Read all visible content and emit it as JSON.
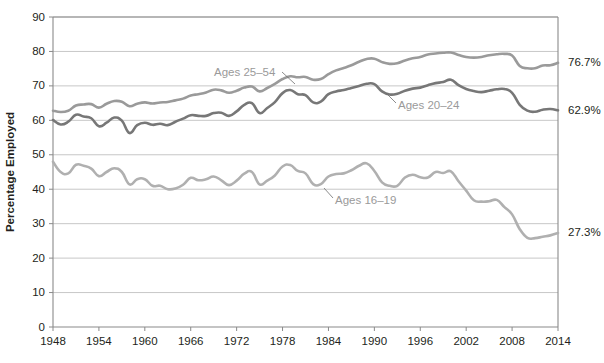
{
  "chart_data": {
    "type": "line",
    "title": "",
    "xlabel": "",
    "ylabel": "Percentage Employed",
    "xlim": [
      1948,
      2014
    ],
    "ylim": [
      0,
      90
    ],
    "grid": true,
    "legend_position": "inline-annotations",
    "yticks": [
      0,
      10,
      20,
      30,
      40,
      50,
      60,
      70,
      80,
      90
    ],
    "ytick_labels": [
      "0",
      "10",
      "20",
      "30",
      "40",
      "50",
      "60",
      "70",
      "80",
      "90"
    ],
    "xticks": [
      1948,
      1954,
      1960,
      1966,
      1972,
      1978,
      1984,
      1990,
      1996,
      2002,
      2008,
      2014
    ],
    "xtick_labels": [
      "1948",
      "1954",
      "1960",
      "1966",
      "1972",
      "1978",
      "1984",
      "1990",
      "1996",
      "2002",
      "2008",
      "2014"
    ],
    "x": [
      1948,
      1949,
      1950,
      1951,
      1952,
      1953,
      1954,
      1955,
      1956,
      1957,
      1958,
      1959,
      1960,
      1961,
      1962,
      1963,
      1964,
      1965,
      1966,
      1967,
      1968,
      1969,
      1970,
      1971,
      1972,
      1973,
      1974,
      1975,
      1976,
      1977,
      1978,
      1979,
      1980,
      1981,
      1982,
      1983,
      1984,
      1985,
      1986,
      1987,
      1988,
      1989,
      1990,
      1991,
      1992,
      1993,
      1994,
      1995,
      1996,
      1997,
      1998,
      1999,
      2000,
      2001,
      2002,
      2003,
      2004,
      2005,
      2006,
      2007,
      2008,
      2009,
      2010,
      2011,
      2012,
      2013,
      2014
    ],
    "series": [
      {
        "name": "Ages 25-54",
        "label": "Ages 25–54",
        "color": "#9a9a9a",
        "end_value_label": "76.7%",
        "end_value": 76.7,
        "values": [
          62.8,
          62.4,
          62.8,
          64.3,
          64.6,
          64.7,
          63.7,
          64.8,
          65.6,
          65.4,
          64.1,
          64.8,
          65.2,
          64.9,
          65.2,
          65.3,
          65.8,
          66.3,
          67.2,
          67.6,
          68.1,
          68.9,
          68.7,
          68.0,
          68.6,
          69.5,
          69.8,
          68.4,
          69.4,
          70.6,
          72.0,
          72.8,
          72.5,
          72.6,
          71.8,
          72.0,
          73.4,
          74.5,
          75.2,
          76.0,
          77.0,
          77.8,
          77.9,
          76.9,
          76.4,
          76.6,
          77.4,
          78.0,
          78.4,
          79.1,
          79.4,
          79.6,
          79.7,
          79.0,
          78.4,
          78.2,
          78.4,
          78.9,
          79.2,
          79.3,
          78.8,
          75.8,
          75.1,
          75.1,
          75.9,
          76.0,
          76.7
        ]
      },
      {
        "name": "Ages 20-24",
        "label": "Ages 20–24",
        "color": "#777777",
        "end_value_label": "62.9%",
        "end_value": 62.9,
        "values": [
          60.1,
          58.8,
          59.6,
          61.6,
          61.1,
          60.6,
          58.3,
          59.3,
          60.8,
          59.9,
          56.3,
          58.6,
          59.3,
          58.7,
          59.0,
          58.6,
          59.6,
          60.5,
          61.5,
          61.3,
          61.3,
          62.1,
          62.2,
          61.3,
          62.6,
          64.5,
          65.0,
          62.1,
          63.6,
          65.3,
          67.9,
          68.8,
          67.6,
          67.3,
          65.2,
          65.4,
          67.6,
          68.4,
          68.8,
          69.4,
          70.0,
          70.6,
          70.5,
          68.4,
          67.5,
          67.7,
          68.6,
          69.2,
          69.5,
          70.2,
          70.8,
          71.1,
          71.8,
          70.2,
          69.1,
          68.5,
          68.2,
          68.6,
          69.0,
          69.1,
          68.0,
          64.5,
          62.8,
          62.5,
          63.1,
          63.3,
          62.9
        ]
      },
      {
        "name": "Ages 16-19",
        "label": "Ages 16–19",
        "color": "#b0b0b0",
        "end_value_label": "27.3%",
        "end_value": 27.3,
        "values": [
          48.0,
          45.0,
          44.6,
          47.1,
          46.8,
          46.0,
          43.8,
          45.0,
          46.1,
          45.0,
          41.4,
          42.9,
          42.9,
          41.0,
          41.0,
          40.0,
          40.2,
          41.3,
          43.3,
          42.6,
          42.9,
          43.7,
          42.6,
          41.2,
          42.5,
          44.5,
          45.0,
          41.4,
          42.5,
          44.0,
          46.6,
          47.0,
          45.3,
          44.6,
          41.5,
          41.5,
          43.7,
          44.4,
          44.6,
          45.5,
          46.8,
          47.5,
          45.3,
          42.0,
          41.0,
          41.0,
          43.4,
          44.2,
          43.5,
          43.4,
          45.0,
          44.7,
          45.2,
          42.3,
          39.6,
          36.8,
          36.4,
          36.5,
          36.9,
          34.8,
          32.7,
          28.4,
          25.9,
          25.8,
          26.2,
          26.6,
          27.3
        ]
      }
    ]
  },
  "plot": {
    "left": 53,
    "right": 558,
    "top": 17,
    "bottom": 327
  }
}
